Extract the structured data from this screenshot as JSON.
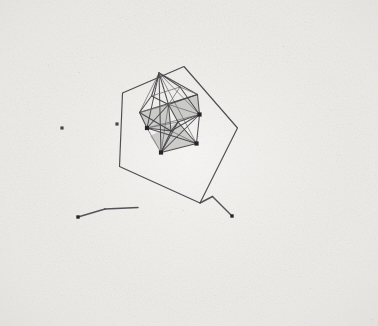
{
  "figure": {
    "kind": "scanned-scientific-illustration",
    "canvas": {
      "width": 378,
      "height": 326
    },
    "colors": {
      "paper": "#f1f0ed",
      "paper_dark": "#e6e4e0",
      "ink": "#3f4044",
      "ink_light": "#6e7075",
      "face_shade": "#a9a9a7",
      "vertex_marker": "#26272a",
      "speck": "#8d8d8c"
    },
    "stroke_widths": {
      "outer_cage": 1.15,
      "inner_cage": 1.05,
      "inner_cage_thin": 0.85,
      "detached_bond": 1.5
    },
    "vertex_marker": {
      "shape": "filled-square",
      "size": 4.2
    }
  },
  "outer_cage": {
    "name": "outer-pentagonal-cage",
    "closed": true,
    "points": [
      [
        184.0,
        66.5
      ],
      [
        237.5,
        128.0
      ],
      [
        200.0,
        203.0
      ],
      [
        119.5,
        166.5
      ],
      [
        122.5,
        93.0
      ]
    ]
  },
  "inner_cluster": {
    "name": "inner-polyhedral-cluster",
    "vertices": [
      {
        "id": "v-apex-top",
        "x": 159.0,
        "y": 73.0,
        "marked": false
      },
      {
        "id": "v-upper-right",
        "x": 197.5,
        "y": 94.5,
        "marked": false
      },
      {
        "id": "v-right-upper",
        "x": 199.5,
        "y": 114.5,
        "marked": true
      },
      {
        "id": "v-right-lower",
        "x": 196.5,
        "y": 143.5,
        "marked": true
      },
      {
        "id": "v-bottom",
        "x": 161.0,
        "y": 152.5,
        "marked": true
      },
      {
        "id": "v-left-lower",
        "x": 147.0,
        "y": 128.0,
        "marked": true
      },
      {
        "id": "v-left-upper",
        "x": 139.5,
        "y": 112.5,
        "marked": false
      },
      {
        "id": "v-mid-upper-left",
        "x": 151.5,
        "y": 96.0,
        "marked": false
      },
      {
        "id": "v-core-upper",
        "x": 168.5,
        "y": 104.5,
        "marked": false
      },
      {
        "id": "v-core-lower",
        "x": 171.0,
        "y": 131.0,
        "marked": false
      },
      {
        "id": "v-front-lower",
        "x": 178.0,
        "y": 122.0,
        "marked": false
      },
      {
        "id": "v-back-mid",
        "x": 180.0,
        "y": 87.0,
        "marked": false
      }
    ],
    "edges": [
      [
        "v-apex-top",
        "v-upper-right"
      ],
      [
        "v-apex-top",
        "v-mid-upper-left"
      ],
      [
        "v-apex-top",
        "v-left-upper"
      ],
      [
        "v-apex-top",
        "v-core-upper"
      ],
      [
        "v-apex-top",
        "v-back-mid"
      ],
      [
        "v-apex-top",
        "v-right-upper"
      ],
      [
        "v-apex-top",
        "v-bottom"
      ],
      [
        "v-apex-top",
        "v-left-lower"
      ],
      [
        "v-apex-top",
        "v-right-lower"
      ],
      [
        "v-upper-right",
        "v-right-upper"
      ],
      [
        "v-upper-right",
        "v-core-upper"
      ],
      [
        "v-upper-right",
        "v-back-mid"
      ],
      [
        "v-upper-right",
        "v-left-upper"
      ],
      [
        "v-right-upper",
        "v-right-lower"
      ],
      [
        "v-right-upper",
        "v-core-upper"
      ],
      [
        "v-right-upper",
        "v-core-lower"
      ],
      [
        "v-right-upper",
        "v-front-lower"
      ],
      [
        "v-right-upper",
        "v-left-lower"
      ],
      [
        "v-right-upper",
        "v-bottom"
      ],
      [
        "v-right-lower",
        "v-bottom"
      ],
      [
        "v-right-lower",
        "v-core-lower"
      ],
      [
        "v-right-lower",
        "v-front-lower"
      ],
      [
        "v-right-lower",
        "v-left-lower"
      ],
      [
        "v-bottom",
        "v-left-lower"
      ],
      [
        "v-bottom",
        "v-core-lower"
      ],
      [
        "v-bottom",
        "v-front-lower"
      ],
      [
        "v-bottom",
        "v-core-upper"
      ],
      [
        "v-left-lower",
        "v-left-upper"
      ],
      [
        "v-left-lower",
        "v-core-lower"
      ],
      [
        "v-left-lower",
        "v-front-lower"
      ],
      [
        "v-left-lower",
        "v-core-upper"
      ],
      [
        "v-left-upper",
        "v-mid-upper-left"
      ],
      [
        "v-left-upper",
        "v-core-upper"
      ],
      [
        "v-left-upper",
        "v-core-lower"
      ],
      [
        "v-mid-upper-left",
        "v-core-upper"
      ],
      [
        "v-mid-upper-left",
        "v-back-mid"
      ],
      [
        "v-core-upper",
        "v-core-lower"
      ],
      [
        "v-core-upper",
        "v-front-lower"
      ],
      [
        "v-core-upper",
        "v-back-mid"
      ],
      [
        "v-core-lower",
        "v-front-lower"
      ],
      [
        "v-back-mid",
        "v-right-upper"
      ]
    ],
    "shaded_faces": [
      {
        "id": "face-upper-right-shade",
        "points": [
          [
            168.5,
            104.5
          ],
          [
            197.5,
            94.5
          ],
          [
            199.5,
            114.5
          ],
          [
            178.0,
            122.0
          ]
        ]
      },
      {
        "id": "face-left-shade",
        "points": [
          [
            139.5,
            112.5
          ],
          [
            168.5,
            104.5
          ],
          [
            171.0,
            131.0
          ],
          [
            147.0,
            128.0
          ]
        ]
      },
      {
        "id": "face-lower-mid-shade",
        "points": [
          [
            150.0,
            136.0
          ],
          [
            178.0,
            122.0
          ],
          [
            196.5,
            143.5
          ],
          [
            161.0,
            152.5
          ]
        ]
      }
    ]
  },
  "detached_bonds": [
    {
      "id": "bond-lower-left-a",
      "points": [
        [
          78.0,
          217.0
        ],
        [
          105.0,
          209.0
        ]
      ],
      "end_dot": {
        "x": 78.0,
        "y": 217.0
      }
    },
    {
      "id": "bond-lower-left-b",
      "points": [
        [
          105.0,
          209.0
        ],
        [
          138.0,
          207.5
        ]
      ],
      "end_dot": null
    },
    {
      "id": "bond-lower-right-a",
      "points": [
        [
          200.0,
          203.0
        ],
        [
          212.5,
          196.5
        ]
      ],
      "end_dot": null
    },
    {
      "id": "bond-lower-right-b",
      "points": [
        [
          212.5,
          196.5
        ],
        [
          232.0,
          216.0
        ]
      ],
      "end_dot": {
        "x": 232.0,
        "y": 216.0
      }
    }
  ],
  "isolated_markers": [
    {
      "id": "marker-left-of-cage",
      "x": 117.0,
      "y": 124.0
    },
    {
      "id": "marker-far-left",
      "x": 62.0,
      "y": 128.0
    }
  ],
  "labels": {
    "figure_caption": "",
    "alt_text": "Polyhedral cluster structure enclosed in pentagonal cage"
  }
}
